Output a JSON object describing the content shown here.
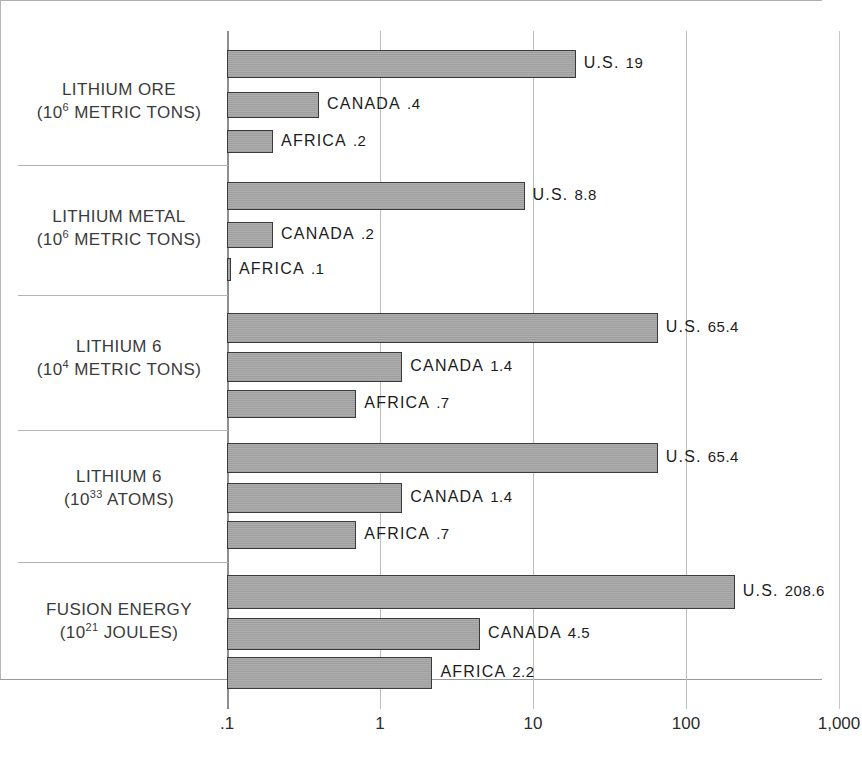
{
  "chart_data": {
    "type": "bar",
    "orientation": "horizontal",
    "title": "",
    "xlabel": "",
    "ylabel": "",
    "scale": "log",
    "xlim": [
      0.1,
      1000
    ],
    "grid": true,
    "legend": "none",
    "tick_labels": [
      ".1",
      "1",
      "10",
      "100",
      "1,000"
    ],
    "tick_values": [
      0.1,
      1,
      10,
      100,
      1000
    ],
    "categories": [
      "LITHIUM ORE (10^6 METRIC TONS)",
      "LITHIUM METAL (10^6 METRIC TONS)",
      "LITHIUM 6 (10^4 METRIC TONS)",
      "LITHIUM 6 (10^33 ATOMS)",
      "FUSION ENERGY (10^21 JOULES)"
    ],
    "series": [
      {
        "name": "U.S.",
        "values": [
          19,
          8.8,
          65.4,
          65.4,
          208.6
        ]
      },
      {
        "name": "CANADA",
        "values": [
          0.4,
          0.2,
          1.4,
          1.4,
          4.5
        ]
      },
      {
        "name": "AFRICA",
        "values": [
          0.2,
          0.1,
          0.7,
          0.7,
          2.2
        ]
      }
    ],
    "groups": [
      {
        "label_line1": "LITHIUM ORE",
        "label_line2_pre": "(10",
        "label_line2_sup": "6",
        "label_line2_post": " METRIC TONS)",
        "bars": [
          {
            "country": "U.S.",
            "value_text": "19",
            "value": 19
          },
          {
            "country": "CANADA",
            "value_text": ".4",
            "value": 0.4
          },
          {
            "country": "AFRICA",
            "value_text": ".2",
            "value": 0.2
          }
        ]
      },
      {
        "label_line1": "LITHIUM METAL",
        "label_line2_pre": "(10",
        "label_line2_sup": "6",
        "label_line2_post": " METRIC TONS)",
        "bars": [
          {
            "country": "U.S.",
            "value_text": "8.8",
            "value": 8.8
          },
          {
            "country": "CANADA",
            "value_text": ".2",
            "value": 0.2
          },
          {
            "country": "AFRICA",
            "value_text": ".1",
            "value": 0.1
          }
        ]
      },
      {
        "label_line1": "LITHIUM 6",
        "label_line2_pre": "(10",
        "label_line2_sup": "4",
        "label_line2_post": " METRIC TONS)",
        "bars": [
          {
            "country": "U.S.",
            "value_text": "65.4",
            "value": 65.4
          },
          {
            "country": "CANADA",
            "value_text": "1.4",
            "value": 1.4
          },
          {
            "country": "AFRICA",
            "value_text": ".7",
            "value": 0.7
          }
        ]
      },
      {
        "label_line1": "LITHIUM 6",
        "label_line2_pre": "(10",
        "label_line2_sup": "33",
        "label_line2_post": " ATOMS)",
        "bars": [
          {
            "country": "U.S.",
            "value_text": "65.4",
            "value": 65.4
          },
          {
            "country": "CANADA",
            "value_text": "1.4",
            "value": 1.4
          },
          {
            "country": "AFRICA",
            "value_text": ".7",
            "value": 0.7
          }
        ]
      },
      {
        "label_line1": "FUSION ENERGY",
        "label_line2_pre": "(10",
        "label_line2_sup": "21",
        "label_line2_post": " JOULES)",
        "bars": [
          {
            "country": "U.S.",
            "value_text": "208.6",
            "value": 208.6
          },
          {
            "country": "CANADA",
            "value_text": "4.5",
            "value": 4.5
          },
          {
            "country": "AFRICA",
            "value_text": "2.2",
            "value": 2.2
          }
        ]
      }
    ],
    "colors": {
      "bar_fill": "#a6a6a6",
      "bar_stroke": "#3a3a3a",
      "gridline": "#bdbdbd",
      "axis": "#8e8e8e",
      "text": "#2c2c2c",
      "background": "#ffffff"
    }
  },
  "layout": {
    "axis_x_px": 227,
    "decade_px": 153,
    "separators_y": [
      31,
      165,
      295,
      430,
      562,
      708
    ],
    "group_bar_rows": [
      [
        [
          50,
          28
        ],
        [
          92,
          26
        ],
        [
          130,
          23
        ]
      ],
      [
        [
          182,
          28
        ],
        [
          222,
          26
        ],
        [
          258,
          23
        ]
      ],
      [
        [
          313,
          30
        ],
        [
          352,
          30
        ],
        [
          390,
          28
        ]
      ],
      [
        [
          443,
          30
        ],
        [
          483,
          30
        ],
        [
          521,
          28
        ]
      ],
      [
        [
          575,
          34
        ],
        [
          618,
          32
        ],
        [
          657,
          32
        ]
      ]
    ],
    "group_label_y": [
      78,
      205,
      335,
      465,
      598
    ]
  }
}
